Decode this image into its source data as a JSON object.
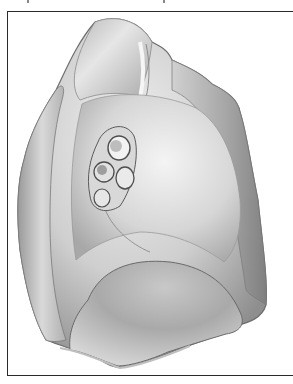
{
  "figure": {
    "caption_visible": false,
    "frame": {
      "border_color": "#2a2a2a",
      "background": "#ffffff"
    },
    "palette": {
      "light": "#e8e8e8",
      "mid": "#b4b4b4",
      "dark": "#7a7a7a",
      "shadow": "#5a5a5a"
    },
    "regions": [
      {
        "name": "apex"
      },
      {
        "name": "anterior-border"
      },
      {
        "name": "cardiac-impression"
      },
      {
        "name": "hilum"
      },
      {
        "name": "diaphragmatic-surface"
      },
      {
        "name": "posterior-border"
      }
    ]
  }
}
